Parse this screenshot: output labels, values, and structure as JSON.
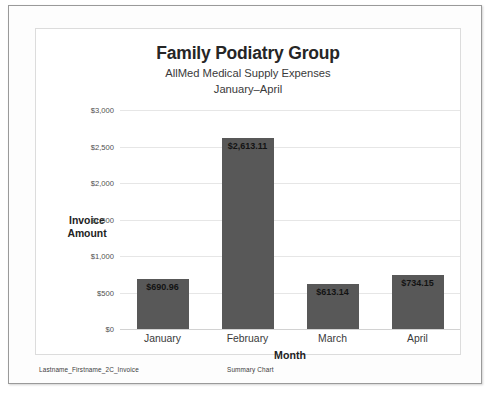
{
  "document": {
    "footer_left": "Lastname_Firstname_2C_Invoice",
    "footer_center": "Summary Chart"
  },
  "chart_data": {
    "type": "bar",
    "title": "Family Podiatry Group",
    "subtitle_1": "AllMed Medical Supply Expenses",
    "subtitle_2": "January–April",
    "xlabel": "Month",
    "ylabel": "Invoice Amount",
    "categories": [
      "January",
      "February",
      "March",
      "April"
    ],
    "values": [
      690.96,
      2613.11,
      613.14,
      734.15
    ],
    "data_labels": [
      "$690.96",
      "$2,613.11",
      "$613.14",
      "$734.15"
    ],
    "ylim": [
      0,
      3000
    ],
    "ytick_values": [
      3000,
      2500,
      2000,
      1500,
      1000,
      500,
      0
    ],
    "ytick_labels": [
      "$3,000",
      "$2,500",
      "$2,000",
      "$1,500",
      "$1,000",
      "$500",
      "$0"
    ],
    "grid": true,
    "legend": false,
    "bar_color": "#585858",
    "plot_background": "#ffffff",
    "gridline_color": "#e6e6e6"
  }
}
